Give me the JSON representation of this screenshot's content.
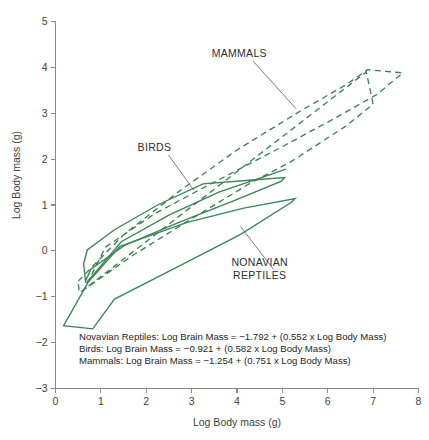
{
  "figure": {
    "background_color": "#ffffff",
    "series_color": "#3b8457",
    "axis_color": "#8a8a8a",
    "text_color": "#3f3f3f"
  },
  "chart_data": {
    "type": "line",
    "title": "",
    "xlabel": "Log Body mass (g)",
    "ylabel": "Log Body mass (g)",
    "xlim": [
      0,
      8
    ],
    "ylim": [
      -3,
      5
    ],
    "xticks": [
      0,
      1,
      2,
      3,
      4,
      5,
      6,
      7,
      8
    ],
    "yticks": [
      -3,
      -2,
      -1,
      0,
      1,
      2,
      3,
      4,
      5
    ],
    "xticklabels": [
      "0",
      "1",
      "2",
      "3",
      "4",
      "5",
      "6",
      "7",
      "8"
    ],
    "yticklabels": [
      "-3",
      "-2",
      "-1",
      "0",
      "1",
      "2",
      "3",
      "4",
      "5"
    ],
    "grid": false,
    "legend_position": "none",
    "series": [
      {
        "name": "Nonavian Reptiles",
        "style": "solid",
        "color": "#3b8457",
        "polygon": [
          [
            0.18,
            -1.63
          ],
          [
            0.72,
            -0.68
          ],
          [
            1.42,
            0.1
          ],
          [
            2.9,
            0.62
          ],
          [
            4.15,
            0.93
          ],
          [
            5.28,
            1.14
          ],
          [
            5.2,
            1.06
          ],
          [
            4.08,
            0.36
          ],
          [
            2.55,
            -0.42
          ],
          [
            1.3,
            -1.05
          ],
          [
            0.82,
            -1.7
          ]
        ]
      },
      {
        "name": "Birds",
        "style": "solid",
        "color": "#3b8457",
        "polygon": [
          [
            0.62,
            -0.28
          ],
          [
            0.7,
            0.02
          ],
          [
            1.3,
            0.46
          ],
          [
            2.25,
            1.0
          ],
          [
            3.25,
            1.46
          ],
          [
            4.4,
            1.55
          ],
          [
            5.05,
            1.6
          ],
          [
            4.98,
            1.52
          ],
          [
            3.95,
            1.1
          ],
          [
            2.72,
            0.62
          ],
          [
            1.52,
            0.12
          ],
          [
            0.78,
            -0.4
          ],
          [
            0.66,
            -0.66
          ]
        ]
      },
      {
        "name": "Birds upper edge",
        "style": "solid",
        "color": "#3b8457",
        "polygon": [
          [
            0.68,
            -0.7
          ],
          [
            1.45,
            0.2
          ],
          [
            2.5,
            0.78
          ],
          [
            3.6,
            1.28
          ],
          [
            4.6,
            1.62
          ],
          [
            5.08,
            1.78
          ]
        ]
      },
      {
        "name": "Mammals",
        "style": "dashed",
        "color": "#3b8457",
        "polygon": [
          [
            0.5,
            -0.66
          ],
          [
            1.5,
            0.35
          ],
          [
            2.7,
            1.28
          ],
          [
            4.0,
            2.2
          ],
          [
            5.4,
            3.05
          ],
          [
            6.4,
            3.62
          ],
          [
            6.88,
            3.95
          ],
          [
            7.65,
            3.88
          ],
          [
            7.1,
            3.42
          ],
          [
            6.1,
            2.86
          ],
          [
            4.9,
            2.22
          ],
          [
            3.5,
            1.5
          ],
          [
            2.2,
            0.82
          ],
          [
            1.1,
            0.08
          ],
          [
            0.62,
            -0.86
          ],
          [
            0.52,
            -0.9
          ]
        ]
      },
      {
        "name": "Mammals mid edge",
        "style": "dashed",
        "color": "#3b8457",
        "polygon": [
          [
            0.58,
            -0.88
          ],
          [
            1.7,
            -0.1
          ],
          [
            3.0,
            0.7
          ],
          [
            4.3,
            1.48
          ],
          [
            5.2,
            1.95
          ],
          [
            6.4,
            2.72
          ],
          [
            7.0,
            3.2
          ],
          [
            6.85,
            3.9
          ]
        ]
      }
    ],
    "annotations": [
      {
        "name": "mammals-label",
        "text": "MAMMALS",
        "x": 4.05,
        "y": 4.22,
        "leader_to": [
          5.3,
          3.1
        ]
      },
      {
        "name": "birds-label",
        "text": "BIRDS",
        "x": 2.18,
        "y": 2.18,
        "leader_to": [
          3.05,
          1.32
        ]
      },
      {
        "name": "nonavian-reptiles-label",
        "line1": "NONAVIAN",
        "line2": "REPTILES",
        "x": 4.5,
        "y": -0.32,
        "leader_to": [
          4.08,
          0.53
        ]
      }
    ],
    "equations": [
      "Novavian Reptiles: Log Brain Mass = −1.792 + (0.552 x Log Body Mass)",
      "Birds: Log Brain Mass = −0.921 + (0.582 x Log Body Mass)",
      "Mammals: Log Brain Mass = −1.254 + (0.751 x Log Body Mass)"
    ],
    "equation_coefficients": [
      {
        "group": "Novavian Reptiles",
        "intercept": -1.792,
        "slope": 0.552
      },
      {
        "group": "Birds",
        "intercept": -0.921,
        "slope": 0.582
      },
      {
        "group": "Mammals",
        "intercept": -1.254,
        "slope": 0.751
      }
    ]
  }
}
